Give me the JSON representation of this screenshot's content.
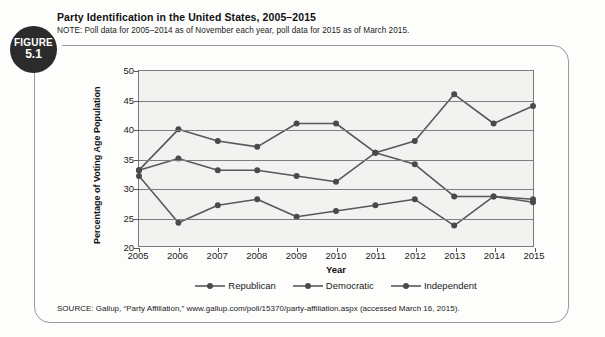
{
  "figure": {
    "badge_top": "FIGURE",
    "badge_number": "5.1"
  },
  "header": {
    "title": "Party Identification in the United States, 2005–2015",
    "note": "NOTE: Poll data for 2005–2014 as of November each year, poll data for 2015 as of March 2015."
  },
  "source": {
    "text": "SOURCE: Gallup, “Party Affiliation,” www.gallup.com/poll/15370/party-affiliation.aspx (accessed March 16, 2015)."
  },
  "colors": {
    "series_line": "#585858",
    "marker": "#4a4a4a",
    "grid": "#7e7e7e",
    "axis": "#7b7b7b",
    "plot_background": "#f2f2f0",
    "badge_background": "#2b2b2b",
    "frame": "#9a9a9a"
  },
  "chart_data": {
    "type": "line",
    "title": "Party Identification in the United States, 2005–2015",
    "subtitle": "NOTE: Poll data for 2005–2014 as of November each year, poll data for 2015 as of March 2015.",
    "xlabel": "Year",
    "ylabel": "Percentage of Voting Age Population",
    "categories": [
      2005,
      2006,
      2007,
      2008,
      2009,
      2010,
      2011,
      2012,
      2013,
      2014,
      2015
    ],
    "x": [
      "2005",
      "2006",
      "2007",
      "2008",
      "2009",
      "2010",
      "2011",
      "2012",
      "2013",
      "2014",
      "2015"
    ],
    "xlim": [
      2005,
      2015
    ],
    "ylim": [
      20,
      50
    ],
    "yticks": [
      20,
      25,
      30,
      35,
      40,
      45,
      50
    ],
    "xticks": [
      "2005",
      "2006",
      "2007",
      "2008",
      "2009",
      "2010",
      "2011",
      "2012",
      "2013",
      "2014",
      "2015"
    ],
    "grid": true,
    "legend_position": "bottom",
    "series": [
      {
        "name": "Republican",
        "values": [
          32,
          24,
          27,
          28,
          25,
          26,
          27,
          28,
          23.5,
          28.5,
          27.5
        ]
      },
      {
        "name": "Democratic",
        "values": [
          33,
          35,
          33,
          33,
          32,
          31,
          36,
          34,
          28.5,
          28.5,
          28
        ]
      },
      {
        "name": "Independent",
        "values": [
          33,
          40,
          38,
          37,
          41,
          41,
          36,
          38,
          46,
          41,
          44
        ]
      }
    ],
    "legend": [
      "Republican",
      "Democratic",
      "Independent"
    ]
  }
}
